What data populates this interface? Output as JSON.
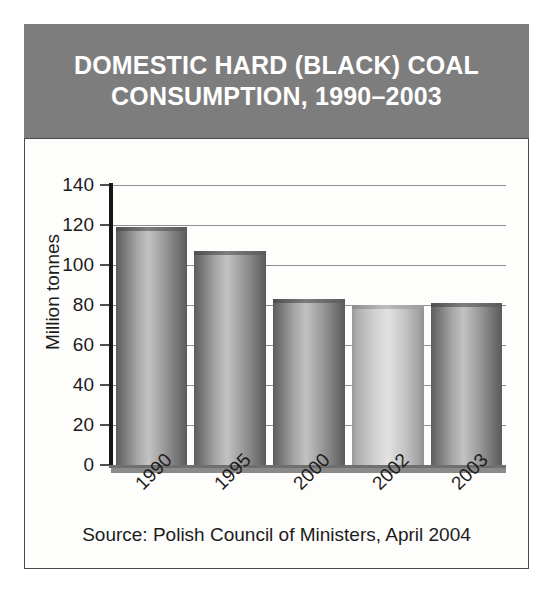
{
  "chart_data": {
    "type": "bar",
    "title": "DOMESTIC HARD (BLACK) COAL CONSUMPTION, 1990–2003",
    "title_line1": "DOMESTIC HARD (BLACK) COAL",
    "title_line2": "CONSUMPTION, 1990–2003",
    "categories": [
      "1990",
      "1995",
      "2000",
      "2002",
      "2003"
    ],
    "values": [
      119,
      107,
      83,
      80,
      81
    ],
    "series": [
      {
        "name": "Domestic hard (black) coal consumption",
        "values": [
          119,
          107,
          83,
          80,
          81
        ]
      }
    ],
    "xlabel": "",
    "ylabel": "Million tonnes",
    "ylim": [
      0,
      140
    ],
    "ytick_values": [
      0,
      20,
      40,
      60,
      80,
      100,
      120,
      140
    ],
    "ytick_labels": [
      "0",
      "20",
      "40",
      "60",
      "80",
      "100",
      "120",
      "140"
    ],
    "grid": true,
    "legend": false,
    "annotation": "Source: Polish Council of Ministers, April 2004",
    "units": "Million tonnes"
  },
  "source": {
    "text": "Source: Polish Council of Ministers, April 2004"
  },
  "colors": {
    "header_band": "#7d7d7d",
    "header_text": "#ffffff",
    "panel_background": "#fdfdfb",
    "panel_border": "#4a4a4a",
    "gridline": "#8e8e8e",
    "axis": "#161616",
    "text": "#1c1c1c",
    "bar_dark": "#6b6b6b",
    "bar_light": "#d2d2d2"
  }
}
